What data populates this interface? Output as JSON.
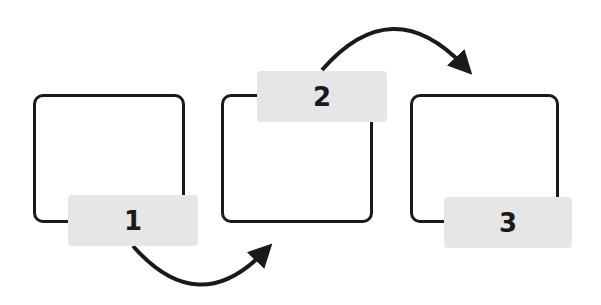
{
  "diagram": {
    "type": "process-flow",
    "steps": [
      {
        "label": "1"
      },
      {
        "label": "2"
      },
      {
        "label": "3"
      }
    ],
    "connections": [
      {
        "from": "1",
        "to": "2",
        "style": "curved-arrow-below"
      },
      {
        "from": "2",
        "to": "3",
        "style": "curved-arrow-above"
      }
    ],
    "colors": {
      "stroke": "#1a1a1a",
      "label_fill": "#e6e6e6",
      "background": "#ffffff"
    }
  }
}
